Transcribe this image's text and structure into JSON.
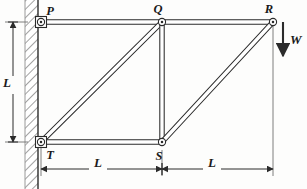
{
  "figure": {
    "type": "structural-truss-diagram",
    "background_color": "#fdfdfc",
    "ink_color": "#2b2b2b",
    "caption": ""
  },
  "joints": [
    {
      "id": "P",
      "label": "P",
      "x": 41,
      "y": 22,
      "support": "pinned-wall",
      "label_x": 50,
      "label_y": 15
    },
    {
      "id": "Q",
      "label": "Q",
      "x": 162,
      "y": 22,
      "support": "free",
      "label_x": 158,
      "label_y": 13
    },
    {
      "id": "R",
      "label": "R",
      "x": 273,
      "y": 22,
      "support": "free",
      "label_x": 269,
      "label_y": 13
    },
    {
      "id": "T",
      "label": "T",
      "x": 41,
      "y": 142,
      "support": "pinned-wall",
      "label_x": 50,
      "label_y": 159
    },
    {
      "id": "S",
      "label": "S",
      "x": 162,
      "y": 142,
      "support": "free",
      "label_x": 159,
      "label_y": 160
    }
  ],
  "members": [
    {
      "id": "PQ",
      "from": "P",
      "to": "Q",
      "kind": "top-chord"
    },
    {
      "id": "QR",
      "from": "Q",
      "to": "R",
      "kind": "top-chord"
    },
    {
      "id": "TS",
      "from": "T",
      "to": "S",
      "kind": "bottom-chord"
    },
    {
      "id": "TQ",
      "from": "T",
      "to": "Q",
      "kind": "diagonal"
    },
    {
      "id": "QS",
      "from": "Q",
      "to": "S",
      "kind": "vertical"
    },
    {
      "id": "SR",
      "from": "S",
      "to": "R",
      "kind": "diagonal"
    }
  ],
  "wall": {
    "label": "fixed-wall",
    "x": 25,
    "y": 0,
    "width": 13,
    "height": 189,
    "hatch_angle_deg": 45
  },
  "load": {
    "label": "W",
    "at_joint": "R",
    "direction": "down",
    "x": 283,
    "y_start": 22,
    "y_end": 62,
    "label_x": 290,
    "label_y": 44
  },
  "dimensions": [
    {
      "id": "vertical-L",
      "label": "L",
      "orientation": "vertical",
      "x": 13,
      "y_start": 22,
      "y_end": 142,
      "label_x": 7,
      "label_y": 87
    },
    {
      "id": "horizontal-L-left",
      "label": "L",
      "orientation": "horizontal",
      "y": 169,
      "x_start": 41,
      "x_end": 162,
      "label_x": 98,
      "label_y": 167
    },
    {
      "id": "horizontal-L-right",
      "label": "L",
      "orientation": "horizontal",
      "y": 169,
      "x_start": 162,
      "x_end": 273,
      "label_x": 212,
      "label_y": 167
    }
  ],
  "extension_lines": [
    {
      "id": "ext-T",
      "x": 41,
      "y_start": 146,
      "y_end": 176
    },
    {
      "id": "ext-S",
      "x": 162,
      "y_start": 150,
      "y_end": 176
    },
    {
      "id": "ext-R",
      "x": 273,
      "y_start": 26,
      "y_end": 176
    },
    {
      "id": "ext-top-left",
      "x_start": 5,
      "x_end": 28,
      "y": 22
    },
    {
      "id": "ext-bottom-left",
      "x_start": 5,
      "x_end": 28,
      "y": 142
    }
  ]
}
